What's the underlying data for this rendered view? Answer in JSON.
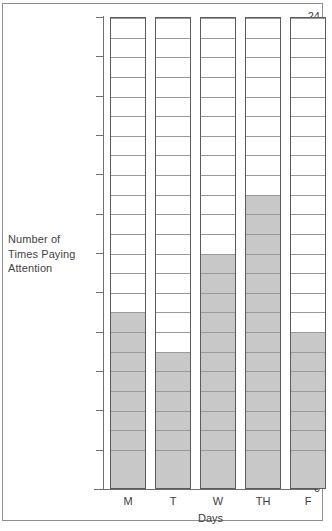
{
  "chart_data": {
    "type": "bar",
    "title": "",
    "subtitle": "",
    "xlabel": "Days",
    "ylabel": "Number of Times Paying Attention",
    "ylabel_lines": [
      "Number of",
      "Times Paying",
      "Attention"
    ],
    "categories": [
      "M",
      "T",
      "W",
      "TH",
      "F"
    ],
    "values": [
      9,
      7,
      12,
      15,
      8
    ],
    "ylim": [
      0,
      24
    ],
    "y_tick_step": 2,
    "y_ticks": [
      0,
      2,
      4,
      6,
      8,
      10,
      12,
      14,
      16,
      18,
      20,
      22,
      24
    ],
    "y_tick_labels": [
      "0",
      "2",
      "4",
      "6",
      "8",
      "10",
      "12",
      "14",
      "16",
      "18",
      "20",
      "22",
      "24"
    ],
    "cell_unit": 1,
    "cells_per_bar": 24,
    "grid": false,
    "legend": null,
    "annotations": [],
    "style": {
      "fill_color": "#c8c8c8",
      "empty_color": "#ffffff",
      "cell_border_color": "#9a9a9a",
      "bar_outline_color": "#5c5c5c",
      "axis_color": "#6f6f6f",
      "text_color": "#3d3d3d",
      "frame_color": "#8e8e8e",
      "background": "#ffffff"
    }
  }
}
